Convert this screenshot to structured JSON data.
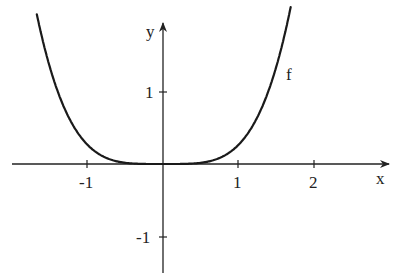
{
  "chart_data": {
    "type": "line",
    "title": "",
    "xlabel": "x",
    "ylabel": "y",
    "series": [
      {
        "name": "f",
        "function": "approx 0.27·x^4 (even function, flat near 0)",
        "x": [
          -1.66,
          -1.5,
          -1.25,
          -1.0,
          -0.75,
          -0.5,
          -0.25,
          0,
          0.25,
          0.5,
          0.75,
          1.0,
          1.25,
          1.5,
          1.68
        ],
        "values": [
          2.05,
          1.37,
          0.66,
          0.27,
          0.085,
          0.017,
          0.001,
          0,
          0.001,
          0.017,
          0.085,
          0.27,
          0.66,
          1.37,
          2.15
        ]
      }
    ],
    "x_ticks": [
      "-1",
      "1",
      "2"
    ],
    "y_ticks": [
      "1",
      "-1"
    ],
    "xlim": [
      -2.1,
      2.95
    ],
    "ylim": [
      -1.5,
      2.2
    ],
    "grid": false,
    "legend": "none",
    "annotations": [
      {
        "text": "f",
        "x": 1.7,
        "y": 0.88
      }
    ]
  },
  "labels": {
    "x_axis": "x",
    "y_axis": "y",
    "curve": "f",
    "tick_x_neg1": "-1",
    "tick_x_1": "1",
    "tick_x_2": "2",
    "tick_y_1": "1",
    "tick_y_neg1": "-1"
  },
  "colors": {
    "axis": "#222222",
    "curve": "#1a1a1a",
    "background": "#ffffff"
  }
}
